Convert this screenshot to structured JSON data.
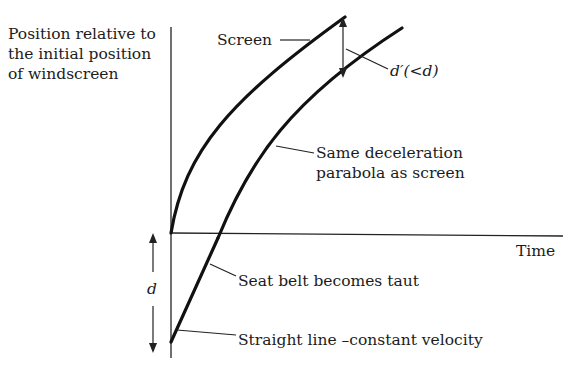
{
  "diagram": {
    "y_axis_label": [
      "Position relative to",
      "the initial position",
      "of windscreen"
    ],
    "x_axis_label": "Time",
    "curves": {
      "screen": {
        "label": "Screen",
        "description": "deceleration parabola starting at origin"
      },
      "occupant": {
        "label_parabola": [
          "Same deceleration",
          "parabola as screen"
        ],
        "label_taut": "Seat belt becomes taut",
        "label_straight": "Straight line –constant velocity"
      }
    },
    "dimensions": {
      "d_label": "d",
      "d_prime_label": "d′(<d)"
    },
    "colors": {
      "ink": "#111111",
      "background": "#ffffff"
    }
  }
}
